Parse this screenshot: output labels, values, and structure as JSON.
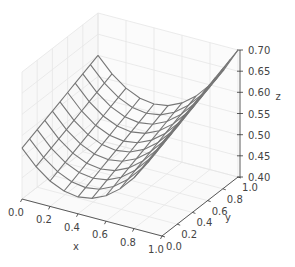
{
  "chart_data": {
    "type": "surface_wireframe_3d",
    "title": "",
    "xlabel": "x",
    "ylabel": "y",
    "zlabel": "z",
    "xlim": [
      0.0,
      1.0
    ],
    "ylim": [
      0.0,
      1.0
    ],
    "zlim": [
      0.4,
      0.7
    ],
    "x_ticks": [
      "0.0",
      "0.2",
      "0.4",
      "0.6",
      "0.8",
      "1.0"
    ],
    "y_ticks": [
      "0.0",
      "0.2",
      "0.4",
      "0.6",
      "0.8",
      "1.0"
    ],
    "z_ticks": [
      "0.40",
      "0.45",
      "0.50",
      "0.55",
      "0.60",
      "0.65",
      "0.70"
    ],
    "grid": true,
    "grid_points": 11,
    "x": [
      0.0,
      0.1,
      0.2,
      0.3,
      0.4,
      0.5,
      0.6,
      0.7,
      0.8,
      0.9,
      1.0
    ],
    "y": [
      0.0,
      0.1,
      0.2,
      0.3,
      0.4,
      0.5,
      0.6,
      0.7,
      0.8,
      0.9,
      1.0
    ],
    "surface_description": "parabolic trough along x (minimum near x=0.4) rising linearly with y",
    "corner_values": {
      "x0_y0": 0.52,
      "x0_y1": 0.6,
      "x1_y0": 0.62,
      "x1_y1": 0.7
    },
    "approx_formula": "z = 0.5*(x-0.4)^2 + 0.44 + 0.08*y",
    "wire_color": "#777777",
    "grid_color": "#e6e6e6"
  }
}
